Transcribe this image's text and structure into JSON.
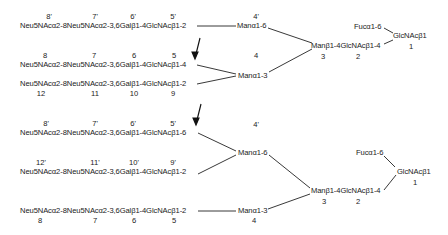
{
  "diagram": {
    "structure_a": {
      "upper_branch": {
        "chain": "Neu5NAcα2-8Neu5NAcα2-3,6Galβ1-4GlcNAcβ1-2",
        "numbers": [
          "8'",
          "7'",
          "6'",
          "5'"
        ],
        "mannose": "Manα1-6",
        "mannose_number": "4'"
      },
      "lower_branch_1": {
        "chain": "Neu5NAcα2-8Neu5NAcα2-3,6Galβ1-4GlcNAcβ1-4",
        "numbers": [
          "8",
          "7",
          "6",
          "5"
        ]
      },
      "lower_branch_2": {
        "chain": "Neu5NAcα2-8Neu5NAcα2-3,6Galβ1-4GlcNAcβ1-2",
        "numbers": [
          "12",
          "11",
          "10",
          "9"
        ]
      },
      "lower_mannose": "Manα1-3",
      "lower_mannose_number": "4",
      "core": "Manβ1-4GlcNAcβ1-4",
      "core_numbers": [
        "3",
        "2"
      ],
      "fucose": "Fucα1-6",
      "reducing_end": "GlcNAcβ1",
      "reducing_end_number": "1"
    },
    "structure_b": {
      "upper_branch_1": {
        "chain": "Neu5NAcα2-8Neu5NAcα2-3,6Galβ1-4GlcNAcβ1-6",
        "numbers": [
          "8'",
          "7'",
          "6'",
          "5'"
        ]
      },
      "upper_branch_2": {
        "chain": "Neu5NAcα2-8Neu5NAcα2-3,6Galβ1-4GlcNAcβ1-2",
        "numbers": [
          "12'",
          "11'",
          "10'",
          "9'"
        ]
      },
      "upper_mannose": "Manα1-6",
      "upper_mannose_number": "4'",
      "lower_branch": {
        "chain": "Neu5NAcα2-8Neu5NAcα2-3,6Galβ1-4GlcNAcβ1-2",
        "numbers": [
          "8",
          "7",
          "6",
          "5"
        ]
      },
      "lower_mannose": "Manα1-3",
      "lower_mannose_number": "4",
      "core": "Manβ1-4GlcNAcβ1-4",
      "core_numbers": [
        "3",
        "2"
      ],
      "fucose": "Fucα1-6",
      "reducing_end": "GlcNAcβ1",
      "reducing_end_number": "1"
    },
    "arrows": [
      "arrow-down-1",
      "arrow-down-2"
    ]
  }
}
